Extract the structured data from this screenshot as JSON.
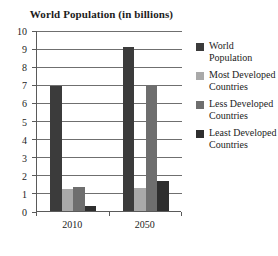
{
  "chart_data": {
    "type": "bar",
    "title": "World Population (in billions)",
    "xlabel": "",
    "ylabel": "",
    "categories": [
      "2010",
      "2050"
    ],
    "series": [
      {
        "name": "World Population",
        "values": [
          6.9,
          9.05
        ],
        "color": "#3b3b3b"
      },
      {
        "name": "Most Developed Countries",
        "values": [
          1.22,
          1.25
        ],
        "color": "#a9a9a9"
      },
      {
        "name": "Less Developed Countries",
        "values": [
          1.3,
          6.9
        ],
        "color": "#6e6e6e"
      },
      {
        "name": "Least Developed Countries",
        "values": [
          0.3,
          1.65
        ],
        "color": "#2e2e2e"
      }
    ],
    "ylim": [
      0,
      10
    ],
    "yticks": [
      "0",
      "1",
      "2",
      "3",
      "4",
      "5",
      "6",
      "7",
      "8",
      "9",
      "10"
    ],
    "grid": true,
    "legend_position": "right"
  },
  "legend": {
    "items": [
      {
        "label": "World Population"
      },
      {
        "label": "Most Developed Countries"
      },
      {
        "label": "Less Developed Countries"
      },
      {
        "label": "Least Developed Countries"
      }
    ]
  }
}
